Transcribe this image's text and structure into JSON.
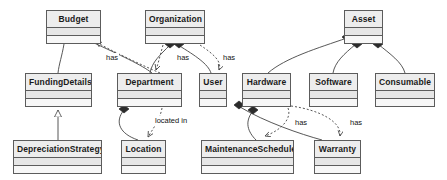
{
  "diagram": {
    "type": "uml-class-diagram",
    "width": 447,
    "height": 180,
    "background": "#ffffff",
    "box_fill": "#f2f2f2",
    "box_header_fill": "#ededed",
    "box_border": "#5c5c5c",
    "edge_color": "#444444"
  },
  "classes": [
    {
      "id": "budget",
      "name": "Budget",
      "x": 46,
      "y": 10,
      "w": 55,
      "h": 34
    },
    {
      "id": "organization",
      "name": "Organization",
      "x": 145,
      "y": 10,
      "w": 60,
      "h": 34
    },
    {
      "id": "asset",
      "name": "Asset",
      "x": 344,
      "y": 10,
      "w": 39,
      "h": 34
    },
    {
      "id": "fundingdetails",
      "name": "FundingDetails",
      "x": 25,
      "y": 73,
      "w": 67,
      "h": 34
    },
    {
      "id": "department",
      "name": "Department",
      "x": 117,
      "y": 73,
      "w": 65,
      "h": 34
    },
    {
      "id": "user",
      "name": "User",
      "x": 199,
      "y": 73,
      "w": 28,
      "h": 34
    },
    {
      "id": "hardware",
      "name": "Hardware",
      "x": 242,
      "y": 73,
      "w": 49,
      "h": 34
    },
    {
      "id": "software",
      "name": "Software",
      "x": 309,
      "y": 73,
      "w": 49,
      "h": 34
    },
    {
      "id": "consumable",
      "name": "Consumable",
      "x": 375,
      "y": 73,
      "w": 60,
      "h": 34
    },
    {
      "id": "depreciationstrategy",
      "name": "DepreciationStrategy",
      "x": 13,
      "y": 140,
      "w": 89,
      "h": 34
    },
    {
      "id": "location",
      "name": "Location",
      "x": 121,
      "y": 140,
      "w": 45,
      "h": 34
    },
    {
      "id": "maintenanceschedule",
      "name": "MaintenanceSchedule",
      "x": 201,
      "y": 140,
      "w": 93,
      "h": 34
    },
    {
      "id": "warranty",
      "name": "Warranty",
      "x": 314,
      "y": 140,
      "w": 47,
      "h": 34
    }
  ],
  "edge_labels": [
    {
      "id": "label-budget-department",
      "text": "has",
      "x": 105,
      "y": 53
    },
    {
      "id": "label-organization-department",
      "text": "has",
      "x": 176,
      "y": 53
    },
    {
      "id": "label-organization-user",
      "text": "has",
      "x": 222,
      "y": 53
    },
    {
      "id": "label-department-location",
      "text": "located in",
      "x": 154,
      "y": 116
    },
    {
      "id": "label-hardware-maintenance",
      "text": "has",
      "x": 294,
      "y": 118
    },
    {
      "id": "label-hardware-warranty",
      "text": "has",
      "x": 349,
      "y": 118
    }
  ],
  "relationships": [
    {
      "id": "budget-fundingdetails",
      "from": "budget",
      "to": "fundingdetails",
      "kind": "aggregation"
    },
    {
      "id": "department-budget",
      "from": "budget",
      "to": "department",
      "kind": "aggregation"
    },
    {
      "id": "budget-department-dependency",
      "from": "department",
      "to": "budget",
      "kind": "dependency"
    },
    {
      "id": "organization-department",
      "from": "organization",
      "to": "department",
      "kind": "aggregation"
    },
    {
      "id": "organization-user",
      "from": "organization",
      "to": "user",
      "kind": "aggregation"
    },
    {
      "id": "organization-department-dep",
      "from": "organization",
      "to": "department",
      "kind": "dependency"
    },
    {
      "id": "organization-user-dep",
      "from": "organization",
      "to": "user",
      "kind": "dependency"
    },
    {
      "id": "asset-hardware",
      "from": "asset",
      "to": "hardware",
      "kind": "aggregation"
    },
    {
      "id": "asset-software",
      "from": "asset",
      "to": "software",
      "kind": "aggregation"
    },
    {
      "id": "asset-consumable",
      "from": "asset",
      "to": "consumable",
      "kind": "aggregation"
    },
    {
      "id": "fundingdetails-depreciation",
      "from": "depreciationstrategy",
      "to": "fundingdetails",
      "kind": "generalization"
    },
    {
      "id": "department-location",
      "from": "department",
      "to": "location",
      "kind": "aggregation"
    },
    {
      "id": "department-location-dep",
      "from": "department",
      "to": "location",
      "kind": "dependency"
    },
    {
      "id": "hardware-maintenanceschedule",
      "from": "hardware",
      "to": "maintenanceschedule",
      "kind": "aggregation"
    },
    {
      "id": "hardware-warranty",
      "from": "hardware",
      "to": "warranty",
      "kind": "aggregation"
    },
    {
      "id": "hardware-maintenance-dep",
      "from": "hardware",
      "to": "maintenanceschedule",
      "kind": "dependency"
    },
    {
      "id": "hardware-warranty-dep",
      "from": "hardware",
      "to": "warranty",
      "kind": "dependency"
    }
  ]
}
